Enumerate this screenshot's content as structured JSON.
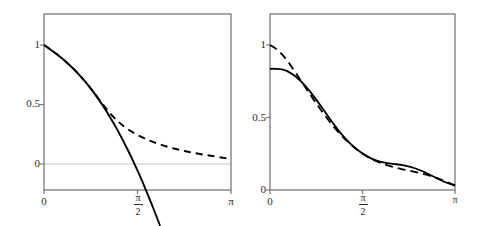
{
  "figure": {
    "background": "#ffffff",
    "panel_count": 2,
    "frame_color": "#7a7a7a",
    "curve_color": "#000000",
    "zero_line_color": "#d8d8d8"
  },
  "chart_data": [
    {
      "type": "line",
      "title": "",
      "subtitle": "",
      "xlabel": "",
      "ylabel": "",
      "panel": "left",
      "grid": false,
      "legend": "none",
      "xlim": [
        0,
        3.14159
      ],
      "ylim": [
        -0.28,
        1.1
      ],
      "xticks": [
        0,
        1.5708,
        3.14159
      ],
      "xticklabels": [
        "0",
        "π/2",
        "π"
      ],
      "xticklabels_text": [
        "0",
        "pi-over-2",
        "pi"
      ],
      "yticks": [
        0,
        0.5,
        1
      ],
      "yticklabels": [
        "0",
        "0.5",
        "1"
      ],
      "zero_line": 0,
      "series": [
        {
          "name": "solid",
          "style": "solid",
          "color": "#000000",
          "x": [
            0.0,
            0.1,
            0.2,
            0.3,
            0.4,
            0.5,
            0.6,
            0.7,
            0.8,
            0.9,
            1.0,
            1.1,
            1.2,
            1.3,
            1.4,
            1.5,
            1.6,
            1.7,
            1.8,
            1.9,
            1.95
          ],
          "y": [
            1.0,
            0.965,
            0.928,
            0.888,
            0.845,
            0.798,
            0.745,
            0.688,
            0.625,
            0.556,
            0.482,
            0.402,
            0.316,
            0.224,
            0.126,
            0.022,
            -0.088,
            -0.204,
            -0.326,
            -0.454,
            -0.52
          ]
        },
        {
          "name": "dashed",
          "style": "dashed",
          "color": "#000000",
          "x": [
            0.0,
            0.2,
            0.4,
            0.6,
            0.8,
            0.95,
            1.1,
            1.25,
            1.4,
            1.6,
            1.8,
            2.0,
            2.2,
            2.4,
            2.6,
            2.8,
            3.0,
            3.14159
          ],
          "y": [
            1.0,
            0.928,
            0.845,
            0.745,
            0.625,
            0.528,
            0.432,
            0.355,
            0.295,
            0.236,
            0.192,
            0.156,
            0.128,
            0.105,
            0.086,
            0.069,
            0.053,
            0.042
          ]
        }
      ]
    },
    {
      "type": "line",
      "title": "",
      "subtitle": "",
      "xlabel": "",
      "ylabel": "",
      "panel": "right",
      "grid": false,
      "legend": "none",
      "xlim": [
        0,
        3.14159
      ],
      "ylim": [
        0,
        1.07
      ],
      "xticks": [
        0,
        1.5708,
        3.14159
      ],
      "xticklabels": [
        "0",
        "π/2",
        "π"
      ],
      "xticklabels_text": [
        "0",
        "pi-over-2",
        "pi"
      ],
      "yticks": [
        0,
        0.5,
        1
      ],
      "yticklabels": [
        "0",
        "0.5",
        "1"
      ],
      "series": [
        {
          "name": "solid",
          "style": "solid",
          "color": "#000000",
          "x": [
            0.0,
            0.1,
            0.2,
            0.3,
            0.45,
            0.6,
            0.75,
            0.9,
            1.05,
            1.2,
            1.35,
            1.5,
            1.65,
            1.8,
            1.95,
            2.1,
            2.25,
            2.4,
            2.55,
            2.7,
            2.85,
            3.0,
            3.14159
          ],
          "y": [
            0.835,
            0.836,
            0.832,
            0.818,
            0.778,
            0.718,
            0.642,
            0.558,
            0.472,
            0.392,
            0.325,
            0.272,
            0.232,
            0.204,
            0.188,
            0.18,
            0.172,
            0.158,
            0.136,
            0.108,
            0.078,
            0.05,
            0.03
          ]
        },
        {
          "name": "dashed",
          "style": "dashed",
          "color": "#000000",
          "x": [
            0.0,
            0.15,
            0.3,
            0.45,
            0.6,
            0.75,
            0.9,
            1.05,
            1.2,
            1.35,
            1.5,
            1.65,
            1.8,
            1.95,
            2.1,
            2.25,
            2.4,
            2.55,
            2.7,
            2.85,
            3.0,
            3.14159
          ],
          "y": [
            1.0,
            0.958,
            0.888,
            0.8,
            0.708,
            0.618,
            0.532,
            0.452,
            0.382,
            0.322,
            0.272,
            0.232,
            0.2,
            0.176,
            0.158,
            0.143,
            0.13,
            0.116,
            0.1,
            0.08,
            0.055,
            0.032
          ]
        }
      ]
    }
  ]
}
